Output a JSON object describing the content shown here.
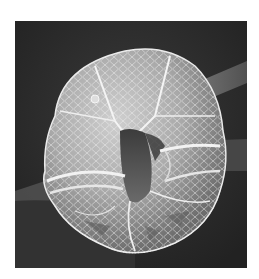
{
  "image": {
    "subject": "SEM micrograph of dinoflagellate cell",
    "alt": "Scanning electron micrograph of an armored dinoflagellate with reticulated thecal plates and cingulum groove",
    "colors": {
      "background": "#ffffff",
      "frame": "#2b2b2b",
      "cell_light": "#d9d9d9",
      "cell_mid": "#a8a8a8",
      "cell_dark": "#4a4a4a",
      "rod": "#6e6e6e"
    }
  }
}
